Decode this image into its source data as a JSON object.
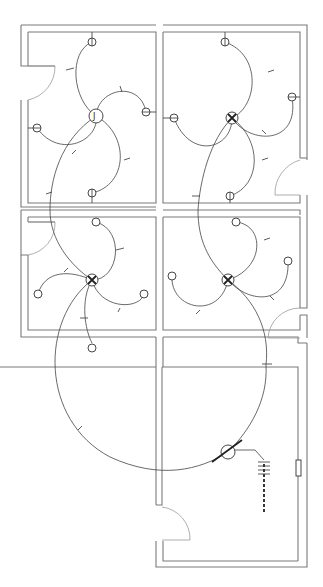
{
  "diagram": {
    "type": "electrical-floor-plan",
    "title": "",
    "colors": {
      "wall": "#7a7a7a",
      "wire": "#444444",
      "background": "#ffffff"
    },
    "rooms": [
      {
        "id": "room-top-left"
      },
      {
        "id": "room-top-right"
      },
      {
        "id": "room-middle-left"
      },
      {
        "id": "room-middle-right"
      },
      {
        "id": "room-bottom-right"
      }
    ],
    "junction_box": {
      "label": "J"
    },
    "fixture_count": 16,
    "panel_label": ""
  }
}
